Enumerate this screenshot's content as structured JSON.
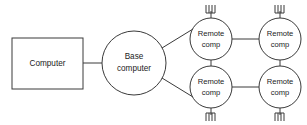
{
  "diagram": {
    "type": "network-topology",
    "background_color": "#ffffff",
    "stroke_color": "#3a3a3a",
    "text_color": "#1b1b1b",
    "nodes": [
      {
        "id": "computer",
        "shape": "rectangle",
        "label": "Computer",
        "label_lines": [
          "Computer"
        ],
        "x": 12,
        "y": 38,
        "width": 71,
        "height": 51,
        "antenna": "none"
      },
      {
        "id": "base-computer",
        "shape": "circle",
        "label": "Base computer",
        "label_lines": [
          "Base",
          "computer"
        ],
        "cx": 134,
        "cy": 63,
        "r": 32,
        "antenna": "none"
      },
      {
        "id": "remote-comp-top-left",
        "shape": "circle",
        "label": "Remote comp",
        "label_lines": [
          "Remote",
          "comp"
        ],
        "cx": 211,
        "cy": 39,
        "r": 21,
        "antenna": "up"
      },
      {
        "id": "remote-comp-top-right",
        "shape": "circle",
        "label": "Remote comp",
        "label_lines": [
          "Remote",
          "comp"
        ],
        "cx": 280,
        "cy": 39,
        "r": 21,
        "antenna": "up"
      },
      {
        "id": "remote-comp-bottom-left",
        "shape": "circle",
        "label": "Remote comp",
        "label_lines": [
          "Remote",
          "comp"
        ],
        "cx": 211,
        "cy": 87,
        "r": 21,
        "antenna": "down"
      },
      {
        "id": "remote-comp-bottom-right",
        "shape": "circle",
        "label": "Remote comp",
        "label_lines": [
          "Remote",
          "comp"
        ],
        "cx": 280,
        "cy": 87,
        "r": 21,
        "antenna": "down"
      }
    ],
    "links": [
      {
        "id": "computer-to-base",
        "from": "computer",
        "to": "base-computer",
        "x1": 83,
        "y1": 63,
        "x2": 102,
        "y2": 63
      },
      {
        "id": "base-to-remote-top-left",
        "from": "base-computer",
        "to": "remote-comp-top-left",
        "x1": 162,
        "y1": 48,
        "x2": 193,
        "y2": 29
      },
      {
        "id": "base-to-remote-bottom-left",
        "from": "base-computer",
        "to": "remote-comp-bottom-left",
        "x1": 162,
        "y1": 78,
        "x2": 193,
        "y2": 97
      },
      {
        "id": "remote-top-left-to-top-right",
        "from": "remote-comp-top-left",
        "to": "remote-comp-top-right",
        "x1": 232,
        "y1": 39,
        "x2": 259,
        "y2": 39
      },
      {
        "id": "remote-bottom-left-to-bottom-right",
        "from": "remote-comp-bottom-left",
        "to": "remote-comp-bottom-right",
        "x1": 232,
        "y1": 87,
        "x2": 259,
        "y2": 87
      },
      {
        "id": "remote-top-left-to-bottom-left",
        "from": "remote-comp-top-left",
        "to": "remote-comp-bottom-left",
        "x1": 211,
        "y1": 60,
        "x2": 211,
        "y2": 66
      },
      {
        "id": "remote-top-right-to-bottom-right",
        "from": "remote-comp-top-right",
        "to": "remote-comp-bottom-right",
        "x1": 280,
        "y1": 60,
        "x2": 280,
        "y2": 66
      }
    ],
    "antenna": {
      "mast_length": 7,
      "element_count": 4,
      "element_length": 9,
      "element_spacing": 3
    }
  }
}
